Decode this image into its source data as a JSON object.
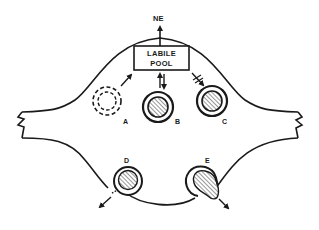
{
  "diagram": {
    "type": "schematic",
    "colors": {
      "stroke": "#1a1a1a",
      "background": "#ffffff"
    },
    "output_label": "NE",
    "pool": {
      "line1": "LABILE",
      "line2": "POOL"
    },
    "vesicles": [
      {
        "id": "A",
        "label": "A",
        "style": "dashed empty",
        "arrow": "to-pool"
      },
      {
        "id": "B",
        "label": "B",
        "style": "hatched core",
        "arrow": "bidirectional"
      },
      {
        "id": "C",
        "label": "C",
        "style": "hatched core",
        "arrow": "blocked from pool"
      },
      {
        "id": "D",
        "label": "D",
        "style": "hatched core, fusing with membrane",
        "arrow": "exocytosis out"
      },
      {
        "id": "E",
        "label": "E",
        "style": "hatched core, releasing content",
        "arrow": "exocytosis out"
      }
    ]
  }
}
